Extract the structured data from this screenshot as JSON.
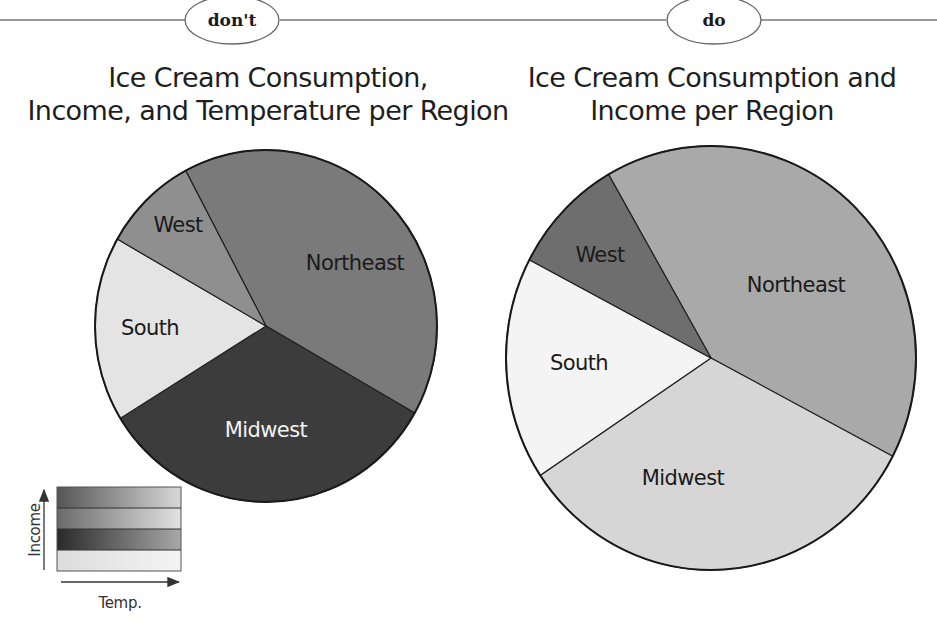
{
  "header": {
    "dont_tag": "don't",
    "do_tag": "do"
  },
  "left_panel": {
    "title_line1": "Ice Cream Consumption,",
    "title_line2": "Income, and Temperature per Region",
    "legend": {
      "y_axis_label": "Income",
      "x_axis_label": "Temp."
    }
  },
  "right_panel": {
    "title_line1": "Ice Cream Consumption and",
    "title_line2": "Income per Region"
  },
  "chart_data": [
    {
      "type": "pie",
      "title": "Ice Cream Consumption, Income, and Temperature per Region",
      "categories": [
        "Northeast",
        "Midwest",
        "South",
        "West"
      ],
      "values": [
        41,
        33,
        17,
        9
      ],
      "unit": "approx. % share (estimated from slice angles)",
      "colors": [
        "#7a7a7a",
        "#3c3c3c",
        "#e4e4e4",
        "#8f8f8f"
      ],
      "label_colors": [
        "#1a1a1a",
        "#f2f2f2",
        "#1a1a1a",
        "#1a1a1a"
      ],
      "start_angle_deg": 332,
      "encoding_note": "Shade encodes Income and Temperature combined (see legend)",
      "legend": {
        "type": "gradient-grid",
        "y_axis": "Income",
        "x_axis": "Temp.",
        "rows": 4
      }
    },
    {
      "type": "pie",
      "title": "Ice Cream Consumption and Income per Region",
      "categories": [
        "Northeast",
        "Midwest",
        "South",
        "West"
      ],
      "values": [
        41,
        33,
        17,
        9
      ],
      "unit": "approx. % share (estimated from slice angles)",
      "colors": [
        "#a9a9a9",
        "#d6d6d6",
        "#f4f4f4",
        "#6e6e6e"
      ],
      "label_colors": [
        "#1a1a1a",
        "#1a1a1a",
        "#1a1a1a",
        "#1a1a1a"
      ],
      "start_angle_deg": 330
    }
  ]
}
